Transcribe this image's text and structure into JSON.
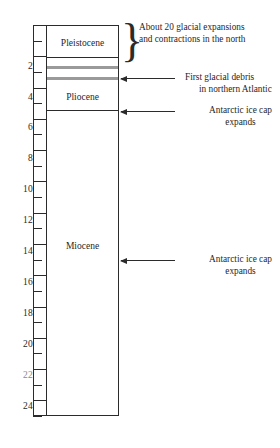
{
  "figure": {
    "type": "geologic-time-column",
    "axis_unit_note": "Ma",
    "epochs": [
      {
        "name": "Pleistocene",
        "label_y": 38
      },
      {
        "name": "Pliocene",
        "label_y": 92
      },
      {
        "name": "Miocene",
        "label_y": 241
      }
    ],
    "axis_labels": [
      {
        "value": "2",
        "y": 67,
        "faded": false
      },
      {
        "value": "4",
        "y": 98,
        "faded": false
      },
      {
        "value": "6",
        "y": 128,
        "faded": false
      },
      {
        "value": "8",
        "y": 159,
        "faded": false
      },
      {
        "value": "10",
        "y": 190,
        "faded": false
      },
      {
        "value": "12",
        "y": 221,
        "faded": false
      },
      {
        "value": "14",
        "y": 252,
        "faded": false
      },
      {
        "value": "16",
        "y": 283,
        "faded": false
      },
      {
        "value": "18",
        "y": 314,
        "faded": false
      },
      {
        "value": "20",
        "y": 345,
        "faded": false
      },
      {
        "value": "22",
        "y": 376,
        "faded": true
      },
      {
        "value": "24",
        "y": 407,
        "faded": false
      }
    ],
    "annotations": [
      {
        "id": "glacial-expansions",
        "line1": "About 20 glacial expansions",
        "line2": "and contractions in the north",
        "marker": "brace",
        "x": 139,
        "y": 22
      },
      {
        "id": "first-glacial-debris",
        "line1": "First glacial debris",
        "line2": "in northern Atlantic",
        "marker": "arrow",
        "x": 185,
        "y": 72,
        "arrow_y": 78,
        "arrow_x": 121,
        "arrow_w": 54
      },
      {
        "id": "antarctic-ice-cap-pliocene",
        "line1": "Antarctic ice cap",
        "line2": "expands",
        "marker": "arrow",
        "x": 185,
        "y": 105,
        "arrow_y": 111,
        "arrow_x": 121,
        "arrow_w": 54
      },
      {
        "id": "antarctic-ice-cap-miocene",
        "line1": "Antarctic ice cap",
        "line2": "expands",
        "marker": "arrow",
        "x": 185,
        "y": 254,
        "arrow_y": 260,
        "arrow_x": 121,
        "arrow_w": 54
      }
    ],
    "colors": {
      "ink": "#2b2b2b",
      "gray_band": "#9a9a9a",
      "background": "#ffffff"
    }
  }
}
